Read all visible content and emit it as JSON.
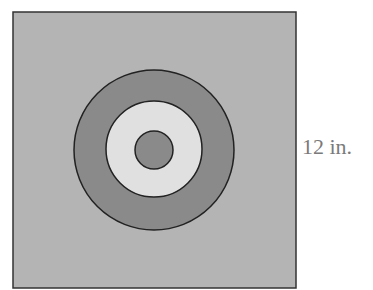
{
  "diagram": {
    "square": {
      "fill": "#b4b4b4",
      "stroke": "#333333"
    },
    "rings": [
      {
        "name": "outer-ring",
        "fill": "#8a8a8a"
      },
      {
        "name": "middle-ring",
        "fill": "#e0e0e0"
      },
      {
        "name": "center-circle",
        "fill": "#8a8a8a"
      }
    ],
    "side_label": "12 in."
  }
}
